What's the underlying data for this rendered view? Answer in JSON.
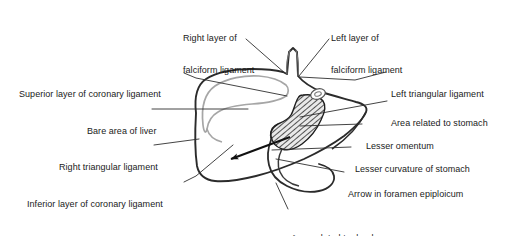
{
  "figure": {
    "background_color": "#ffffff",
    "line_color": "#222222",
    "secondary_line_color": "#9a9a9a",
    "text_color": "#1a1a1a",
    "width": 520,
    "height": 236
  },
  "labels": [
    {
      "id": "right-layer-falciform-ligament",
      "text_line1": "Right layer of",
      "text_line2": "falciform ligament",
      "x": 183,
      "y": 12,
      "align": "left"
    },
    {
      "id": "left-layer-falciform-ligament",
      "text_line1": "Left layer of",
      "text_line2": "falciform ligament",
      "x": 331,
      "y": 12,
      "align": "left"
    },
    {
      "id": "superior-layer-coronary-ligament",
      "text_line1": "Superior layer of coronary ligament",
      "text_line2": "",
      "x": 19,
      "y": 68,
      "align": "left"
    },
    {
      "id": "left-triangular-ligament",
      "text_line1": "Left triangular ligament",
      "text_line2": "",
      "x": 391,
      "y": 68,
      "align": "left"
    },
    {
      "id": "bare-area-of-liver",
      "text_line1": "Bare area of liver",
      "text_line2": "",
      "x": 87,
      "y": 105,
      "align": "left"
    },
    {
      "id": "area-related-to-stomach",
      "text_line1": "Area related to stomach",
      "text_line2": "",
      "x": 391,
      "y": 97,
      "align": "left"
    },
    {
      "id": "lesser-omentum",
      "text_line1": "Lesser omentum",
      "text_line2": "",
      "x": 366,
      "y": 120,
      "align": "left"
    },
    {
      "id": "right-triangular-ligament",
      "text_line1": "Right triangular ligament",
      "text_line2": "",
      "x": 59,
      "y": 141,
      "align": "left"
    },
    {
      "id": "lesser-curvature-of-stomach",
      "text_line1": "Lesser curvature of stomach",
      "text_line2": "",
      "x": 355,
      "y": 143,
      "align": "left"
    },
    {
      "id": "arrow-in-foramen-epiploicum",
      "text_line1": "Arrow in foramen epiploicum",
      "text_line2": "",
      "x": 348,
      "y": 168,
      "align": "left"
    },
    {
      "id": "inferior-layer-coronary-ligament",
      "text_line1": "Inferior layer of coronary ligament",
      "text_line2": "",
      "x": 27,
      "y": 178,
      "align": "left"
    },
    {
      "id": "area-related-to-duodenum",
      "text_line1": "Area related to duodenum",
      "text_line2": "",
      "x": 291,
      "y": 212,
      "align": "left"
    }
  ],
  "structures": {
    "liver_outline": "main dark outline of posterior liver surface",
    "bare_area_inner": "gray inner contour marking the bare area",
    "lesser_omentum_hatched": "hatched crescent-shaped band",
    "foramen_arrow": "black arrow pointing to lower-left through the epiploic foramen",
    "caval_groove": "vertical stalk at superior margin between falciform layers"
  }
}
